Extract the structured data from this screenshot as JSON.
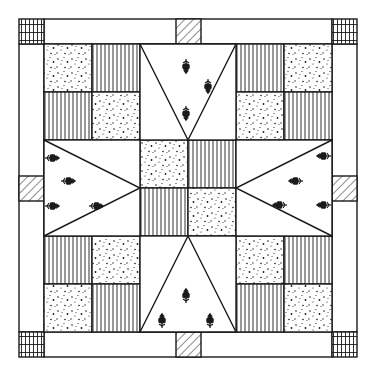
{
  "colors": {
    "line": "#1a1a1a",
    "background": "#ffffff",
    "fabric_plain": "#ffffff"
  },
  "geometry": {
    "outer": [
      19,
      19,
      357,
      357
    ],
    "border_width": 25,
    "inner": [
      44,
      44,
      332,
      332
    ],
    "cell": 96,
    "quarter": 48
  },
  "fabrics": {
    "dotted": "speckled-dot-print",
    "striped": "vertical-stripe-print",
    "hatched": "diagonal-hatch-print",
    "plaid": "checked-plaid-print",
    "tulip": "tulip-motif-print"
  },
  "four_patches": [
    {
      "position": "top-left",
      "cells": [
        "dotted",
        "striped",
        "striped",
        "dotted"
      ]
    },
    {
      "position": "top-right",
      "cells": [
        "striped",
        "dotted",
        "dotted",
        "striped"
      ]
    },
    {
      "position": "bottom-left",
      "cells": [
        "striped",
        "dotted",
        "dotted",
        "striped"
      ]
    },
    {
      "position": "bottom-right",
      "cells": [
        "dotted",
        "striped",
        "striped",
        "dotted"
      ]
    },
    {
      "position": "center",
      "cells": [
        "dotted",
        "striped",
        "striped",
        "dotted"
      ]
    }
  ],
  "star_points": [
    {
      "position": "top",
      "direction": "down",
      "motif": "tulip"
    },
    {
      "position": "bottom",
      "direction": "up",
      "motif": "tulip"
    },
    {
      "position": "left",
      "direction": "right",
      "motif": "tulip"
    },
    {
      "position": "right",
      "direction": "left",
      "motif": "tulip"
    }
  ],
  "border_corners": [
    "top-left",
    "top-right",
    "bottom-left",
    "bottom-right"
  ],
  "border_centers": [
    "top",
    "bottom",
    "left",
    "right"
  ]
}
